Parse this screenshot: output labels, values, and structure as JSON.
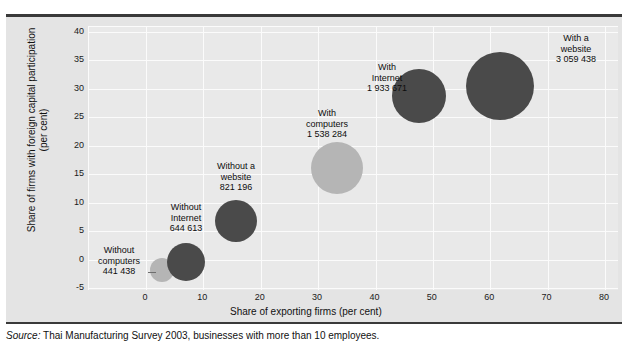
{
  "figure": {
    "source_prefix": "Source:",
    "source_text": " Thai Manufacturing Survey 2003, businesses with more than 10 employees."
  },
  "chart_data": {
    "type": "scatter",
    "title": "",
    "xlabel": "Share of exporting firms (per cent)",
    "ylabel": "Share of firms with foreign capital participation (per cent)",
    "ylabel_line1": "Share of firms with foreign capital participation",
    "ylabel_line2": "(per cent)",
    "xlim": [
      -2,
      80
    ],
    "ylim": [
      -5,
      40
    ],
    "xticks": [
      "0",
      "10",
      "20",
      "30",
      "40",
      "50",
      "60",
      "70",
      "80"
    ],
    "xtick_values": [
      0,
      10,
      20,
      30,
      40,
      50,
      60,
      70,
      80
    ],
    "yticks": [
      "40",
      "35",
      "30",
      "25",
      "20",
      "15",
      "10",
      "5",
      "0",
      "-5"
    ],
    "ytick_values": [
      40,
      35,
      30,
      25,
      20,
      15,
      10,
      5,
      0,
      -5
    ],
    "grid": true,
    "legend": "none",
    "size_metric": "Number of firms",
    "colors": {
      "bubble_dark": "#4a4a4a",
      "bubble_light": "#b5b5b5",
      "plot_background": "#e9e9e9",
      "figure_background": "#e4e4e4",
      "gridline": "#fbfbfb",
      "rule": "#3a3a3a"
    },
    "points": [
      {
        "label": "Without computers",
        "label_lines": "Without\ncomputers\n441 438",
        "value_text": "441 438",
        "value": 441438,
        "x": 2.8,
        "y": 0.8,
        "color": "#b5b5b5",
        "radius_px": 12,
        "cx_px": 162,
        "cy_px": 270,
        "label_left_px": 88,
        "label_top_px": 245,
        "label_width_px": 62,
        "leader_left_px": 148,
        "leader_top_px": 272,
        "leader_width_px": 8
      },
      {
        "label": "Without Internet",
        "label_lines": "Without\nInternet\n644 613",
        "value_text": "644 613",
        "value": 644613,
        "x": 6.5,
        "y": 3.4,
        "color": "#4a4a4a",
        "radius_px": 19,
        "cx_px": 186,
        "cy_px": 262,
        "label_left_px": 152,
        "label_top_px": 202,
        "label_width_px": 68,
        "leader_left_px": 0,
        "leader_top_px": 0,
        "leader_width_px": 0
      },
      {
        "label": "Without a website",
        "label_lines": "Without a\nwebsite\n821 196",
        "value_text": "821 196",
        "value": 821196,
        "x": 15.5,
        "y": 9.2,
        "color": "#4a4a4a",
        "radius_px": 21,
        "cx_px": 236,
        "cy_px": 221,
        "label_left_px": 200,
        "label_top_px": 161,
        "label_width_px": 72,
        "leader_left_px": 0,
        "leader_top_px": 0,
        "leader_width_px": 0
      },
      {
        "label": "With computers",
        "label_lines": "With\ncomputers\n1 538 284",
        "value_text": "1 538 284",
        "value": 1538284,
        "x": 33.5,
        "y": 19.2,
        "color": "#b5b5b5",
        "radius_px": 26,
        "cx_px": 337,
        "cy_px": 168,
        "label_left_px": 288,
        "label_top_px": 108,
        "label_width_px": 78,
        "leader_left_px": 0,
        "leader_top_px": 0,
        "leader_width_px": 0
      },
      {
        "label": "With Internet",
        "label_lines": "With\nInternet\n1 933 671",
        "value_text": "1 933 671",
        "value": 1933671,
        "x": 47.6,
        "y": 31.8,
        "color": "#4a4a4a",
        "radius_px": 27,
        "cx_px": 419,
        "cy_px": 96,
        "label_left_px": 352,
        "label_top_px": 62,
        "label_width_px": 70,
        "leader_left_px": 0,
        "leader_top_px": 0,
        "leader_width_px": 0
      },
      {
        "label": "With a website",
        "label_lines": "With a\nwebsite\n3 059 438",
        "value_text": "3 059 438",
        "value": 3059438,
        "x": 61.8,
        "y": 33.5,
        "color": "#4a4a4a",
        "radius_px": 34,
        "cx_px": 500,
        "cy_px": 86,
        "label_left_px": 538,
        "label_top_px": 33,
        "label_width_px": 76,
        "leader_left_px": 0,
        "leader_top_px": 0,
        "leader_width_px": 0
      }
    ]
  }
}
